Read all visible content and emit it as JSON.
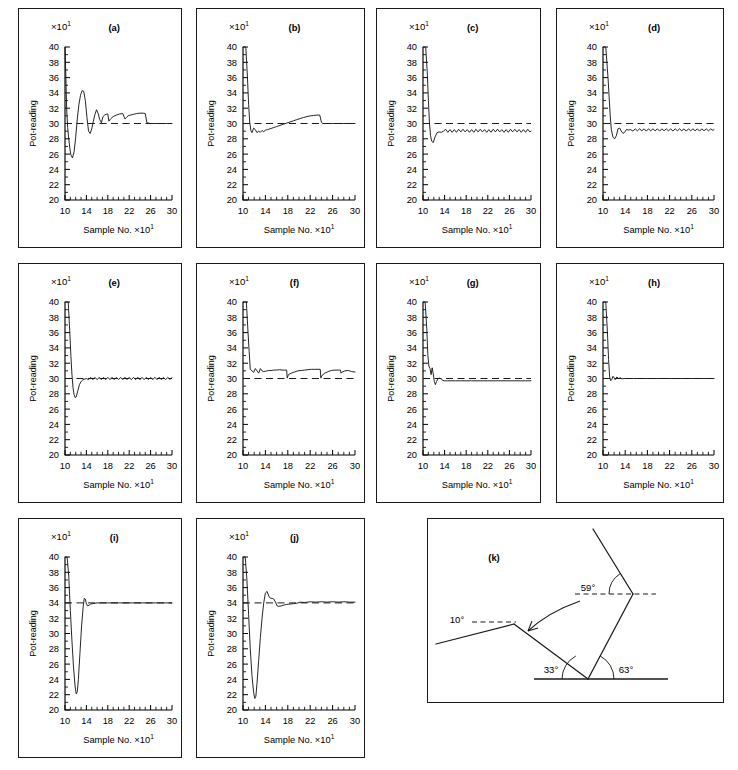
{
  "figure": {
    "axis_y_label": "Pot-reading",
    "axis_x_label": "Sample No.",
    "multiplier_base": "×10",
    "multiplier_exp": "1",
    "x_ticks": [
      "10",
      "14",
      "18",
      "22",
      "26",
      "30"
    ],
    "y_ticks_a": [
      "20",
      "22",
      "24",
      "26",
      "28",
      "30",
      "32",
      "34",
      "36",
      "38",
      "40"
    ],
    "line_color": "#1a1a1a"
  },
  "panels": [
    {
      "letter": "(a)"
    },
    {
      "letter": "(b)"
    },
    {
      "letter": "(c)"
    },
    {
      "letter": "(d)"
    },
    {
      "letter": "(e)"
    },
    {
      "letter": "(f)"
    },
    {
      "letter": "(g)"
    },
    {
      "letter": "(h)"
    },
    {
      "letter": "(i)"
    },
    {
      "letter": "(j)"
    },
    {
      "letter": "(k)"
    }
  ],
  "diagram_k": {
    "letter": "(k)",
    "angles": [
      {
        "name": "angle-10",
        "label": "10°"
      },
      {
        "name": "angle-33",
        "label": "33°"
      },
      {
        "name": "angle-63",
        "label": "63°"
      },
      {
        "name": "angle-59",
        "label": "59°"
      }
    ]
  },
  "chart_data": [
    {
      "type": "line",
      "panel": "(a)",
      "title": "(a)",
      "xlabel": "Sample No. ×10¹",
      "ylabel": "Pot-reading ×10¹",
      "xlim": [
        10,
        30
      ],
      "ylim": [
        20,
        40
      ],
      "xticks": [
        10,
        14,
        18,
        22,
        26,
        30
      ],
      "yticks": [
        20,
        22,
        24,
        26,
        28,
        30,
        32,
        34,
        36,
        38,
        40
      ],
      "grid": false,
      "reference_line": 30,
      "x": [
        10.0,
        10.15,
        10.3,
        10.5,
        10.7,
        10.9,
        11.1,
        11.4,
        11.7,
        12.0,
        12.3,
        12.6,
        12.9,
        13.2,
        13.5,
        13.8,
        14.1,
        14.4,
        14.7,
        15.0,
        15.3,
        15.6,
        15.9,
        16.2,
        16.5,
        16.8,
        17.1,
        17.4,
        17.7,
        18.0,
        18.2,
        18.5,
        19.0,
        19.6,
        20.2,
        20.8,
        21.2,
        21.5,
        21.8,
        22.2,
        22.8,
        23.4,
        24.0,
        24.6,
        25.0,
        25.3,
        25.6,
        26.0,
        27.0,
        28.0,
        29.0,
        30.0
      ],
      "y": [
        40.0,
        36.5,
        32.0,
        29.5,
        28.0,
        26.8,
        25.9,
        25.5,
        26.3,
        28.2,
        30.6,
        32.5,
        33.7,
        34.3,
        34.2,
        33.0,
        30.8,
        29.0,
        28.7,
        29.3,
        30.3,
        31.2,
        31.8,
        31.3,
        30.5,
        30.1,
        30.9,
        31.1,
        31.2,
        31.25,
        30.3,
        30.6,
        30.9,
        31.1,
        31.25,
        31.3,
        30.6,
        30.8,
        31.0,
        31.1,
        31.2,
        31.3,
        31.35,
        31.35,
        31.3,
        30.1,
        30.05,
        30.0,
        30.0,
        30.0,
        30.0,
        30.0
      ]
    },
    {
      "type": "line",
      "panel": "(b)",
      "title": "(b)",
      "xlabel": "Sample No. ×10¹",
      "ylabel": "Pot-reading ×10¹",
      "xlim": [
        10,
        30
      ],
      "ylim": [
        20,
        40
      ],
      "xticks": [
        10,
        14,
        18,
        22,
        26,
        30
      ],
      "yticks": [
        20,
        22,
        24,
        26,
        28,
        30,
        32,
        34,
        36,
        38,
        40
      ],
      "grid": false,
      "reference_line": 30,
      "x": [
        10.0,
        10.5,
        10.8,
        11.0,
        11.2,
        11.4,
        11.6,
        11.9,
        12.2,
        12.5,
        12.8,
        13.1,
        13.4,
        13.7,
        14.0,
        14.4,
        14.8,
        15.4,
        16.0,
        16.6,
        17.2,
        17.8,
        18.4,
        19.0,
        19.6,
        20.2,
        20.8,
        21.4,
        22.0,
        22.6,
        23.2,
        23.7,
        24.0,
        24.2,
        24.5,
        25.0,
        26.0,
        27.0,
        28.0,
        29.0,
        30.0
      ],
      "y": [
        40.0,
        40.0,
        36.0,
        32.5,
        30.2,
        29.1,
        28.8,
        29.4,
        29.2,
        28.8,
        29.0,
        28.85,
        29.1,
        28.9,
        29.15,
        29.2,
        29.3,
        29.45,
        29.6,
        29.75,
        29.9,
        30.05,
        30.2,
        30.35,
        30.5,
        30.65,
        30.78,
        30.9,
        31.0,
        31.05,
        31.1,
        31.1,
        30.2,
        30.0,
        30.0,
        30.0,
        30.0,
        30.0,
        30.0,
        30.0,
        30.0
      ]
    },
    {
      "type": "line",
      "panel": "(c)",
      "title": "(c)",
      "xlabel": "Sample No. ×10¹",
      "ylabel": "Pot-reading ×10¹",
      "xlim": [
        10,
        30
      ],
      "ylim": [
        20,
        40
      ],
      "xticks": [
        10,
        14,
        18,
        22,
        26,
        30
      ],
      "yticks": [
        20,
        22,
        24,
        26,
        28,
        30,
        32,
        34,
        36,
        38,
        40
      ],
      "grid": false,
      "reference_line": 30,
      "x": [
        10.0,
        10.5,
        10.8,
        11.0,
        11.2,
        11.4,
        11.6,
        11.9,
        12.2,
        12.6,
        13.0,
        13.4,
        13.8,
        14.2,
        14.6,
        15.0,
        15.4,
        15.8,
        16.2,
        16.6,
        17.0,
        17.4,
        17.8,
        18.2,
        18.6,
        19.0,
        19.4,
        19.8,
        20.2,
        20.6,
        21.0,
        21.4,
        21.8,
        22.2,
        22.6,
        23.0,
        23.4,
        23.8,
        24.2,
        24.6,
        25.0,
        25.4,
        25.8,
        26.2,
        26.6,
        27.0,
        27.4,
        27.8,
        28.2,
        28.6,
        29.0,
        29.4,
        29.8,
        30.0
      ],
      "y": [
        40.0,
        40.0,
        36.5,
        33.0,
        30.0,
        28.4,
        27.7,
        27.5,
        28.2,
        28.8,
        28.9,
        28.85,
        29.0,
        29.25,
        28.85,
        29.2,
        28.85,
        29.2,
        28.85,
        29.25,
        28.9,
        29.25,
        28.9,
        29.2,
        28.85,
        29.2,
        28.85,
        29.25,
        28.9,
        29.25,
        28.9,
        29.2,
        28.85,
        29.2,
        28.85,
        29.25,
        28.9,
        29.25,
        28.9,
        29.2,
        28.85,
        29.2,
        28.85,
        29.25,
        28.9,
        29.25,
        28.9,
        29.2,
        28.85,
        29.2,
        28.85,
        29.25,
        28.9,
        29.0
      ]
    },
    {
      "type": "line",
      "panel": "(d)",
      "title": "(d)",
      "xlabel": "Sample No. ×10¹",
      "ylabel": "Pot-reading ×10¹",
      "xlim": [
        10,
        30
      ],
      "ylim": [
        20,
        40
      ],
      "xticks": [
        10,
        14,
        18,
        22,
        26,
        30
      ],
      "yticks": [
        20,
        22,
        24,
        26,
        28,
        30,
        32,
        34,
        36,
        38,
        40
      ],
      "grid": false,
      "reference_line": 30,
      "x": [
        10.0,
        10.5,
        10.9,
        11.1,
        11.3,
        11.5,
        11.8,
        12.1,
        12.4,
        12.7,
        13.0,
        13.3,
        13.6,
        13.9,
        14.2,
        14.6,
        15.0,
        15.4,
        15.8,
        16.2,
        16.6,
        17.0,
        17.4,
        17.8,
        18.2,
        18.6,
        19.0,
        19.4,
        19.8,
        20.2,
        20.6,
        21.0,
        21.4,
        21.8,
        22.2,
        22.6,
        23.0,
        23.4,
        23.8,
        24.2,
        24.6,
        25.0,
        25.4,
        25.8,
        26.2,
        26.6,
        27.0,
        27.4,
        27.8,
        28.2,
        28.6,
        29.0,
        29.4,
        29.8,
        30.0
      ],
      "y": [
        40.0,
        40.0,
        36.0,
        33.5,
        31.0,
        29.2,
        28.2,
        28.0,
        28.4,
        29.3,
        29.4,
        29.0,
        28.7,
        28.85,
        29.2,
        29.15,
        29.2,
        29.0,
        29.3,
        29.05,
        29.3,
        29.05,
        29.3,
        29.0,
        29.3,
        29.05,
        29.3,
        29.05,
        29.3,
        29.0,
        29.3,
        29.05,
        29.3,
        29.05,
        29.3,
        29.0,
        29.3,
        29.05,
        29.3,
        29.05,
        29.3,
        29.0,
        29.3,
        29.05,
        29.3,
        29.05,
        29.3,
        29.0,
        29.3,
        29.05,
        29.3,
        29.05,
        29.3,
        29.1,
        29.2
      ]
    },
    {
      "type": "line",
      "panel": "(e)",
      "title": "(e)",
      "xlabel": "Sample No. ×10¹",
      "ylabel": "Pot-reading ×10¹",
      "xlim": [
        10,
        30
      ],
      "ylim": [
        20,
        40
      ],
      "xticks": [
        10,
        14,
        18,
        22,
        26,
        30
      ],
      "yticks": [
        20,
        22,
        24,
        26,
        28,
        30,
        32,
        34,
        36,
        38,
        40
      ],
      "grid": false,
      "reference_line": 30,
      "x": [
        10.0,
        10.6,
        10.9,
        11.1,
        11.3,
        11.5,
        11.7,
        11.9,
        12.1,
        12.4,
        12.7,
        13.0,
        13.3,
        13.6,
        14.0,
        14.4,
        14.8,
        15.2,
        15.6,
        16.0,
        16.4,
        16.8,
        17.2,
        17.6,
        18.0,
        18.4,
        18.8,
        19.2,
        19.6,
        20.0,
        20.4,
        20.8,
        21.2,
        21.6,
        22.0,
        22.4,
        22.8,
        23.2,
        23.6,
        24.0,
        24.4,
        24.8,
        25.2,
        25.6,
        26.0,
        26.4,
        26.8,
        27.2,
        27.6,
        28.0,
        28.4,
        28.8,
        29.2,
        29.6,
        30.0
      ],
      "y": [
        40.0,
        40.0,
        36.0,
        33.0,
        30.5,
        28.8,
        27.9,
        27.5,
        27.6,
        28.4,
        29.2,
        29.6,
        29.8,
        29.9,
        30.0,
        29.85,
        30.15,
        29.85,
        30.15,
        29.85,
        30.15,
        29.85,
        30.15,
        29.85,
        30.15,
        29.85,
        30.15,
        29.85,
        30.15,
        29.85,
        30.15,
        29.85,
        30.15,
        29.85,
        30.15,
        29.85,
        30.15,
        29.85,
        30.15,
        29.85,
        30.15,
        29.85,
        30.15,
        29.85,
        30.15,
        29.85,
        30.15,
        29.85,
        30.15,
        29.85,
        30.15,
        29.85,
        30.15,
        29.9,
        30.1
      ]
    },
    {
      "type": "line",
      "panel": "(f)",
      "title": "(f)",
      "xlabel": "Sample No. ×10¹",
      "ylabel": "Pot-reading ×10¹",
      "xlim": [
        10,
        30
      ],
      "ylim": [
        20,
        40
      ],
      "xticks": [
        10,
        14,
        18,
        22,
        26,
        30
      ],
      "yticks": [
        20,
        22,
        24,
        26,
        28,
        30,
        32,
        34,
        36,
        38,
        40
      ],
      "grid": false,
      "reference_line": 30,
      "x": [
        10.0,
        10.6,
        10.9,
        11.1,
        11.3,
        11.6,
        11.9,
        12.2,
        12.5,
        12.8,
        13.1,
        13.4,
        13.7,
        14.0,
        14.3,
        14.6,
        15.0,
        15.5,
        16.0,
        16.5,
        17.0,
        17.5,
        17.8,
        17.9,
        18.1,
        18.6,
        19.2,
        19.8,
        20.4,
        21.0,
        21.6,
        22.2,
        22.8,
        23.4,
        23.8,
        23.9,
        24.1,
        24.6,
        25.2,
        25.8,
        26.4,
        27.0,
        27.4,
        27.5,
        27.7,
        28.2,
        28.8,
        29.4,
        30.0
      ],
      "y": [
        40.0,
        40.0,
        36.0,
        33.5,
        31.2,
        31.0,
        30.8,
        31.3,
        31.0,
        30.7,
        31.3,
        31.0,
        30.9,
        30.95,
        31.0,
        31.05,
        31.05,
        31.1,
        31.1,
        31.15,
        31.1,
        31.1,
        31.1,
        30.05,
        30.5,
        30.7,
        30.85,
        31.0,
        31.05,
        31.1,
        31.15,
        31.2,
        31.2,
        31.2,
        31.2,
        30.05,
        30.4,
        30.7,
        30.9,
        31.05,
        31.1,
        31.1,
        31.1,
        30.7,
        30.85,
        31.0,
        31.05,
        30.9,
        30.85
      ]
    },
    {
      "type": "line",
      "panel": "(g)",
      "title": "(g)",
      "xlabel": "Sample No. ×10¹",
      "ylabel": "Pot-reading ×10¹",
      "xlim": [
        10,
        30
      ],
      "ylim": [
        20,
        40
      ],
      "xticks": [
        10,
        14,
        18,
        22,
        26,
        30
      ],
      "yticks": [
        20,
        22,
        24,
        26,
        28,
        30,
        32,
        34,
        36,
        38,
        40
      ],
      "grid": false,
      "reference_line": 30,
      "x": [
        10.0,
        10.4,
        10.7,
        10.9,
        11.1,
        11.3,
        11.5,
        11.7,
        11.9,
        12.1,
        12.3,
        12.5,
        12.8,
        13.1,
        13.4,
        13.7,
        14.0,
        14.5,
        15.0,
        16.0,
        17.0,
        18.0,
        19.0,
        20.0,
        21.0,
        22.0,
        23.0,
        24.0,
        25.0,
        26.0,
        27.0,
        28.0,
        29.0,
        30.0
      ],
      "y": [
        40.0,
        40.0,
        36.5,
        33.0,
        31.6,
        31.3,
        30.5,
        31.4,
        30.6,
        29.6,
        29.2,
        29.6,
        30.0,
        30.05,
        29.9,
        29.75,
        29.7,
        29.7,
        29.7,
        29.7,
        29.7,
        29.7,
        29.7,
        29.7,
        29.7,
        29.7,
        29.7,
        29.7,
        29.7,
        29.7,
        29.7,
        29.7,
        29.7,
        29.7
      ]
    },
    {
      "type": "line",
      "panel": "(h)",
      "title": "(h)",
      "xlabel": "Sample No. ×10¹",
      "ylabel": "Pot-reading ×10¹",
      "xlim": [
        10,
        30
      ],
      "ylim": [
        20,
        40
      ],
      "xticks": [
        10,
        14,
        18,
        22,
        26,
        30
      ],
      "yticks": [
        20,
        22,
        24,
        26,
        28,
        30,
        32,
        34,
        36,
        38,
        40
      ],
      "grid": false,
      "reference_line": 30,
      "x": [
        10.0,
        10.5,
        10.8,
        11.0,
        11.2,
        11.4,
        11.6,
        11.8,
        12.0,
        12.2,
        12.5,
        12.8,
        13.1,
        13.4,
        13.8,
        14.5,
        15.5,
        17.0,
        19.0,
        21.0,
        23.0,
        25.0,
        27.0,
        29.0,
        30.0
      ],
      "y": [
        40.0,
        40.0,
        36.0,
        32.5,
        30.2,
        29.7,
        29.9,
        30.3,
        30.1,
        29.85,
        30.2,
        30.0,
        30.1,
        29.95,
        30.0,
        30.0,
        30.0,
        30.0,
        30.0,
        30.0,
        30.0,
        30.0,
        30.0,
        30.0,
        30.0
      ]
    },
    {
      "type": "line",
      "panel": "(i)",
      "title": "(i)",
      "xlabel": "Sample No. ×10¹",
      "ylabel": "Pot-reading ×10¹",
      "xlim": [
        10,
        30
      ],
      "ylim": [
        20,
        40
      ],
      "xticks": [
        10,
        14,
        18,
        22,
        26,
        30
      ],
      "yticks": [
        20,
        22,
        24,
        26,
        28,
        30,
        32,
        34,
        36,
        38,
        40
      ],
      "grid": false,
      "reference_line": 34,
      "x": [
        10.0,
        10.4,
        10.7,
        11.0,
        11.3,
        11.6,
        11.9,
        12.1,
        12.3,
        12.5,
        12.8,
        13.1,
        13.4,
        13.6,
        13.8,
        14.0,
        14.2,
        14.5,
        14.8,
        15.2,
        15.6,
        16.0,
        17.0,
        18.0,
        19.0,
        20.0,
        22.0,
        24.0,
        26.0,
        28.0,
        30.0
      ],
      "y": [
        40.0,
        40.0,
        37.5,
        33.0,
        29.0,
        25.5,
        23.0,
        22.1,
        22.4,
        24.0,
        27.5,
        31.0,
        33.5,
        34.6,
        34.5,
        33.9,
        33.6,
        33.7,
        33.85,
        33.9,
        33.95,
        34.0,
        34.0,
        34.0,
        34.0,
        34.0,
        34.0,
        34.0,
        34.0,
        34.0,
        34.0
      ]
    },
    {
      "type": "line",
      "panel": "(j)",
      "title": "(j)",
      "xlabel": "Sample No. ×10¹",
      "ylabel": "Pot-reading ×10¹",
      "xlim": [
        10,
        30
      ],
      "ylim": [
        20,
        40
      ],
      "xticks": [
        10,
        14,
        18,
        22,
        26,
        30
      ],
      "yticks": [
        20,
        22,
        24,
        26,
        28,
        30,
        32,
        34,
        36,
        38,
        40
      ],
      "grid": false,
      "reference_line": 34,
      "x": [
        10.0,
        10.4,
        10.7,
        11.0,
        11.3,
        11.6,
        11.9,
        12.1,
        12.3,
        12.5,
        12.8,
        13.1,
        13.4,
        13.7,
        14.0,
        14.3,
        14.6,
        14.9,
        15.2,
        15.5,
        15.8,
        16.1,
        16.4,
        16.8,
        17.2,
        17.8,
        18.4,
        19.0,
        19.6,
        20.2,
        21.0,
        22.0,
        23.0,
        24.0,
        25.0,
        26.0,
        27.0,
        28.0,
        29.0,
        30.0
      ],
      "y": [
        40.0,
        40.0,
        37.0,
        32.5,
        28.0,
        24.5,
        22.3,
        21.5,
        21.8,
        23.5,
        26.5,
        29.5,
        32.0,
        34.0,
        35.3,
        35.5,
        34.9,
        34.6,
        34.6,
        34.5,
        34.1,
        33.6,
        33.55,
        33.6,
        33.7,
        33.8,
        33.85,
        33.9,
        33.95,
        34.1,
        34.05,
        34.15,
        34.1,
        34.15,
        34.1,
        34.15,
        34.1,
        34.15,
        34.1,
        34.1
      ]
    }
  ]
}
